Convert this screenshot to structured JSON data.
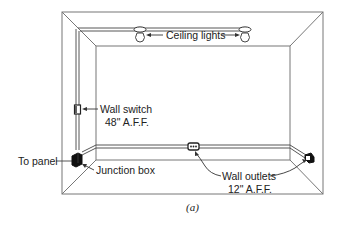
{
  "figure": {
    "caption": "(a)",
    "labels": {
      "ceiling_lights": "Ceiling lights",
      "wall_switch": "Wall switch",
      "wall_switch_height": "48\" A.F.F.",
      "to_panel": "To panel",
      "junction_box": "Junction box",
      "wall_outlets": "Wall outlets",
      "wall_outlets_height": "12\" A.F.F."
    },
    "components": [
      {
        "type": "ceiling-light",
        "count": 2
      },
      {
        "type": "wall-switch",
        "count": 1
      },
      {
        "type": "junction-box",
        "count": 1
      },
      {
        "type": "wall-outlet",
        "count": 2
      }
    ],
    "colors": {
      "line": "#333333",
      "frame": "#666666",
      "background": "#ffffff"
    }
  }
}
